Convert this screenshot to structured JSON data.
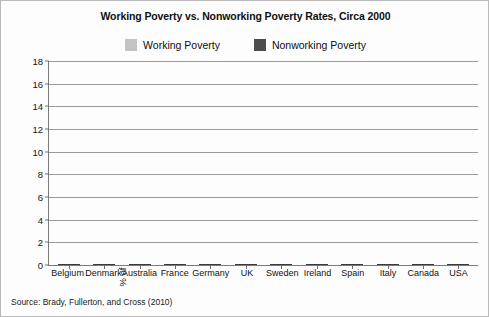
{
  "chart_data": {
    "type": "bar",
    "subtype": "stacked-vertical",
    "title": "Working Poverty vs. Nonworking Poverty Rates, Circa 2000",
    "xlabel": "",
    "ylabel": "% of households in poverty",
    "ylim": [
      0,
      18
    ],
    "yticks": [
      0,
      2,
      4,
      6,
      8,
      10,
      12,
      14,
      16,
      18
    ],
    "grid": true,
    "legend_position": "top-center",
    "source": "Source: Brady, Fullerton, and Cross (2010)",
    "categories": [
      "Belgium",
      "Denmark",
      "Australia",
      "France",
      "Germany",
      "UK",
      "Sweden",
      "Ireland",
      "Spain",
      "Italy",
      "Canada",
      "USA"
    ],
    "series": [
      {
        "name": "Working Poverty",
        "color": "#c3c3c3",
        "values": [
          2.0,
          2.3,
          3.3,
          2.8,
          3.7,
          3.8,
          4.7,
          5.3,
          6.6,
          7.2,
          7.8,
          11.0
        ]
      },
      {
        "name": "Nonworking Poverty",
        "color": "#4d4d4d",
        "values": [
          6.0,
          3.2,
          9.1,
          4.9,
          4.7,
          9.8,
          3.9,
          10.7,
          7.2,
          5.3,
          4.3,
          5.9
        ]
      }
    ],
    "totals": [
      8.0,
      5.5,
      12.4,
      7.7,
      8.4,
      13.6,
      8.6,
      16.0,
      13.8,
      12.5,
      12.1,
      16.9
    ]
  }
}
